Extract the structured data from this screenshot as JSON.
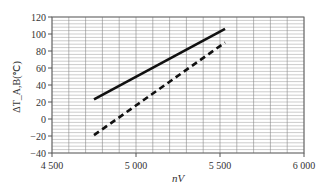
{
  "chart_data": {
    "type": "line",
    "title": "",
    "xlabel": "nV",
    "ylabel": "ΔT_A,B(℃)",
    "xlim": [
      4500,
      6000
    ],
    "ylim": [
      -40,
      120
    ],
    "xticks": [
      4500,
      5000,
      5500,
      6000
    ],
    "xtick_labels": [
      "4 500",
      "5 000",
      "5 500",
      "6 000"
    ],
    "yticks": [
      -40,
      -20,
      0,
      20,
      40,
      60,
      80,
      100,
      120
    ],
    "ytick_labels": [
      "−40",
      "−20",
      "0",
      "20",
      "40",
      "60",
      "80",
      "100",
      "120"
    ],
    "grid": true,
    "legend": null,
    "series": [
      {
        "name": "solid",
        "style": "solid",
        "x": [
          4750,
          5530
        ],
        "y": [
          23,
          106
        ]
      },
      {
        "name": "dashed",
        "style": "dashed",
        "x": [
          4750,
          5530
        ],
        "y": [
          -19,
          90
        ]
      }
    ]
  }
}
